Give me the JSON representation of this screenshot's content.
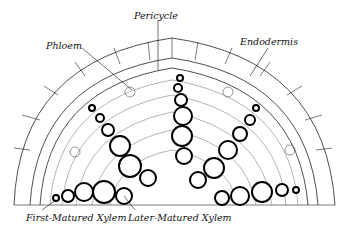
{
  "diagram": {
    "labels": {
      "pericycle": "Pericycle",
      "phloem": "Phloem",
      "endodermis": "Endodermis",
      "first_xylem": "First-Matured Xylem",
      "later_xylem": "Later-Matured Xylem"
    },
    "colors": {
      "ink": "#111111",
      "background": "#ffffff"
    }
  }
}
